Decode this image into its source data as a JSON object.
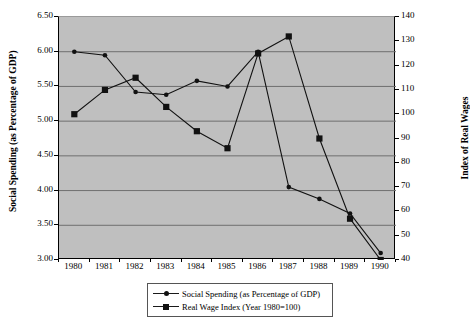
{
  "chart_data": {
    "type": "line",
    "title": "",
    "xlabel": "",
    "ylabel": "Social Spending (as Percentage of GDP)",
    "y2label": "Index of Real Wages",
    "categories": [
      "1980",
      "1981",
      "1982",
      "1983",
      "1984",
      "1985",
      "1986",
      "1987",
      "1988",
      "1989",
      "1990"
    ],
    "ylim": [
      3.0,
      6.5
    ],
    "yticks": [
      "3.00",
      "3.50",
      "4.00",
      "4.50",
      "5.00",
      "5.50",
      "6.00",
      "6.50"
    ],
    "y2lim": [
      40,
      140
    ],
    "y2ticks": [
      "40",
      "50",
      "60",
      "70",
      "80",
      "90",
      "100",
      "110",
      "120",
      "130",
      "140"
    ],
    "grid": true,
    "legend_position": "bottom",
    "plot_background": "#bfbfbf",
    "series": [
      {
        "name": "Social Spending (as Percentage of GDP)",
        "axis": "left",
        "marker": "circle",
        "color": "#111111",
        "values": [
          6.0,
          5.95,
          5.42,
          5.38,
          5.58,
          5.5,
          6.0,
          4.05,
          3.88,
          3.67,
          3.1
        ]
      },
      {
        "name": "Real Wage Index (Year 1980=100)",
        "axis": "right",
        "marker": "square",
        "color": "#111111",
        "values": [
          100,
          110,
          115,
          103,
          93,
          86,
          125,
          132,
          90,
          57,
          40
        ]
      }
    ]
  },
  "legend": {
    "items": [
      {
        "label": "Social Spending (as Percentage of GDP)",
        "marker": "circle"
      },
      {
        "label": "Real Wage Index (Year 1980=100)",
        "marker": "square"
      }
    ]
  },
  "axis_titles": {
    "left": "Social Spending (as Percentage of GDP)",
    "right": "Index of Real Wages"
  }
}
